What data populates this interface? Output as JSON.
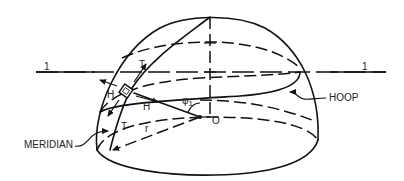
{
  "diagram": {
    "labels": {
      "axis_left": "1",
      "axis_right": "1",
      "t_top": "T",
      "h_left": "H",
      "h_right": "H",
      "t_bottom": "T",
      "angle": "φ",
      "angle_sub": "1",
      "radius": "r",
      "center": "O",
      "meridian": "MERIDIAN",
      "hoop": "HOOP"
    },
    "colors": {
      "line": "#111111",
      "text": "#222222",
      "background": "#ffffff"
    }
  }
}
